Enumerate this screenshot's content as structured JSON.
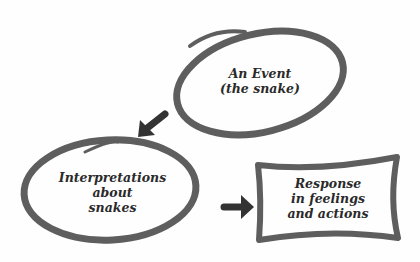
{
  "diagram": {
    "nodes": [
      {
        "id": "event",
        "shape": "ellipse",
        "lines": [
          "An Event",
          "(the snake)"
        ]
      },
      {
        "id": "interpretations",
        "shape": "ellipse",
        "lines": [
          "Interpretations",
          "about",
          "snakes"
        ]
      },
      {
        "id": "response",
        "shape": "rectangle",
        "lines": [
          "Response",
          "in feelings",
          "and actions"
        ]
      }
    ],
    "edges": [
      {
        "from": "event",
        "to": "interpretations"
      },
      {
        "from": "interpretations",
        "to": "response"
      }
    ],
    "colors": {
      "stroke": "#5a5a5a",
      "arrow": "#333333",
      "text": "#2a2a2a"
    }
  }
}
